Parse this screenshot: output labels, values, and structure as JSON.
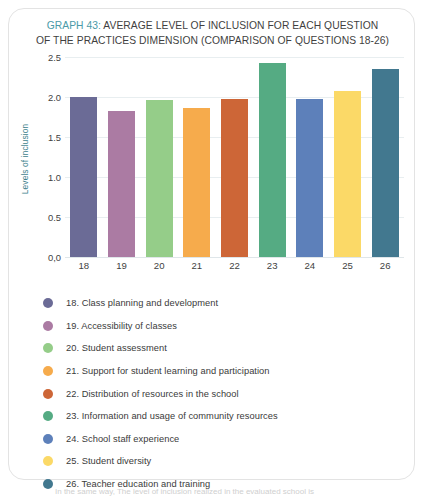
{
  "chart_data": {
    "type": "bar",
    "title": "GRAPH 43: AVERAGE LEVEL OF INCLUSION FOR EACH QUESTION OF THE PRACTICES DIMENSION (COMPARISON OF QUESTIONS 18-26)",
    "title_accent": "GRAPH 43:",
    "title_line1": "GRAPH 43: AVERAGE LEVEL OF INCLUSION FOR EACH QUESTION",
    "title_line1_rest": " AVERAGE LEVEL OF INCLUSION FOR EACH QUESTION",
    "title_line2": "OF THE PRACTICES DIMENSION (COMPARISON OF QUESTIONS 18-26)",
    "xlabel": "",
    "ylabel": "Levels of inclusion",
    "ylim": [
      0,
      2.5
    ],
    "grid": true,
    "legend_position": "below",
    "ytick_labels": [
      "2.5",
      "2.0",
      "1.5",
      "1.0",
      "0.5",
      "0,0"
    ],
    "ytick_values": [
      2.5,
      2.0,
      1.5,
      1.0,
      0.5,
      0.0
    ],
    "categories": [
      "18",
      "19",
      "20",
      "21",
      "22",
      "23",
      "24",
      "25",
      "26"
    ],
    "values": [
      2.0,
      1.83,
      1.96,
      1.86,
      1.98,
      2.43,
      1.98,
      2.07,
      2.35
    ],
    "colors": [
      "#6b6b96",
      "#ab7ba3",
      "#95cd89",
      "#f6ab4c",
      "#cd6637",
      "#55ab83",
      "#5d80ba",
      "#fbd967",
      "#42788f"
    ]
  },
  "legend": {
    "items": [
      {
        "label": "18. Class planning and development",
        "color": "#6b6b96"
      },
      {
        "label": "19. Accessibility of classes",
        "color": "#ab7ba3"
      },
      {
        "label": "20. Student assessment",
        "color": "#95cd89"
      },
      {
        "label": "21. Support for student learning and participation",
        "color": "#f6ab4c"
      },
      {
        "label": "22. Distribution of resources in the school",
        "color": "#cd6637"
      },
      {
        "label": "23. Information and usage of community resources",
        "color": "#55ab83"
      },
      {
        "label": "24. School staff experience",
        "color": "#5d80ba"
      },
      {
        "label": "25. Student diversity",
        "color": "#fbd967"
      },
      {
        "label": "26. Teacher education and training",
        "color": "#42788f"
      }
    ]
  },
  "caption": {
    "clipped_text": "In the same way, The level of inclusion realized in the evaluated school is"
  }
}
